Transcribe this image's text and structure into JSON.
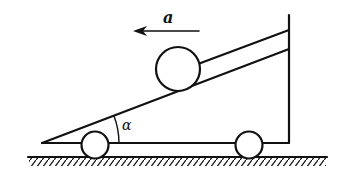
{
  "diagram": {
    "type": "physics-mechanics",
    "labels": {
      "acceleration": "a",
      "angle": "α"
    },
    "colors": {
      "stroke": "#111111",
      "background": "#ffffff"
    },
    "elements": {
      "incline": {
        "x1": 42,
        "y1": 143,
        "x2": 289,
        "y2": 49
      },
      "base": {
        "x1": 42,
        "y1": 143,
        "x2": 289,
        "y2": 143
      },
      "wall": {
        "x": 289,
        "y1": 15,
        "y2": 143
      },
      "rod": {
        "x1": 198,
        "y1": 64,
        "x2": 289,
        "y2": 30
      },
      "ball": {
        "cx": 178,
        "cy": 69,
        "r": 22
      },
      "wheels": [
        {
          "cx": 95,
          "cy": 145,
          "r": 14
        },
        {
          "cx": 249,
          "cy": 145,
          "r": 14
        }
      ],
      "ground": {
        "x1": 28,
        "y1": 157,
        "x2": 327
      },
      "arrow": {
        "x1": 199,
        "x2": 133,
        "y": 31,
        "direction": "left"
      },
      "angle_arc": {
        "cx": 42,
        "cy": 143,
        "r": 77
      }
    }
  }
}
